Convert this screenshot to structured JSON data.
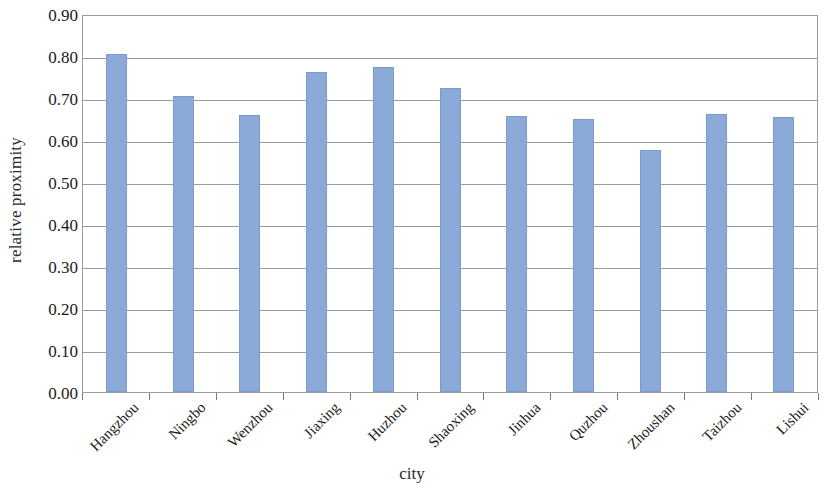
{
  "chart_data": {
    "type": "bar",
    "title": "",
    "xlabel": "city",
    "ylabel": "relative proximity",
    "categories": [
      "Hangzhou",
      "Ningbo",
      "Wenzhou",
      "Jiaxing",
      "Huzhou",
      "Shaoxing",
      "Jinhua",
      "Quzhou",
      "Zhoushan",
      "Taizhou",
      "Lishui"
    ],
    "values": [
      0.805,
      0.705,
      0.66,
      0.763,
      0.775,
      0.724,
      0.656,
      0.649,
      0.576,
      0.663,
      0.654
    ],
    "ylim": [
      0.0,
      0.9
    ],
    "ytick_labels": [
      "0.90",
      "0.80",
      "0.70",
      "0.60",
      "0.50",
      "0.40",
      "0.30",
      "0.20",
      "0.10",
      "0.00"
    ],
    "ytick_values": [
      0.9,
      0.8,
      0.7,
      0.6,
      0.5,
      0.4,
      0.3,
      0.2,
      0.1,
      0.0
    ],
    "grid": true,
    "legend": false,
    "legend_position": "none",
    "bar_color": "#8CAAD8",
    "grid_color": "#9B9B9B",
    "background_color": "#FFFFFF"
  }
}
